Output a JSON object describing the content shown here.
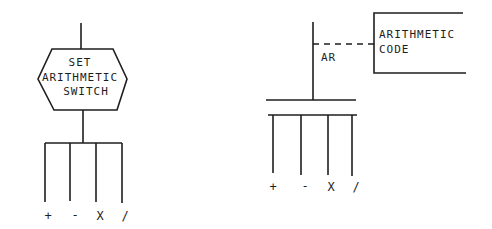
{
  "left_diagram": {
    "decision_box": {
      "shape": "hexagon",
      "lines": [
        "SET",
        "ARITHMETIC",
        "SWITCH"
      ]
    },
    "branches": [
      "+",
      "-",
      "X",
      "/"
    ]
  },
  "right_diagram": {
    "register_label": "AR",
    "annotation": {
      "lines": [
        "ARITHMETIC",
        "CODE"
      ]
    },
    "branches": [
      "+",
      "-",
      "X",
      "/"
    ]
  },
  "colors": {
    "ink": "#1e1e1e",
    "background": "#ffffff"
  }
}
